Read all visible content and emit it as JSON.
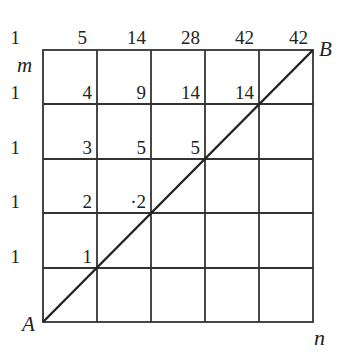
{
  "diagram": {
    "grid": {
      "cols": 5,
      "rows": 5
    },
    "points": {
      "A": "A",
      "B": "B"
    },
    "axes": {
      "m": "m",
      "n": "n"
    },
    "top_row": [
      "1",
      "5",
      "14",
      "28",
      "42",
      "42"
    ],
    "rows": [
      {
        "left": "1",
        "values": [
          "4",
          "9",
          "14",
          "14"
        ]
      },
      {
        "left": "1",
        "values": [
          "3",
          "5",
          "5"
        ]
      },
      {
        "left": "1",
        "values": [
          "2",
          "·2"
        ]
      },
      {
        "left": "1",
        "values": [
          "1"
        ]
      }
    ],
    "diagonal": "A to B"
  }
}
